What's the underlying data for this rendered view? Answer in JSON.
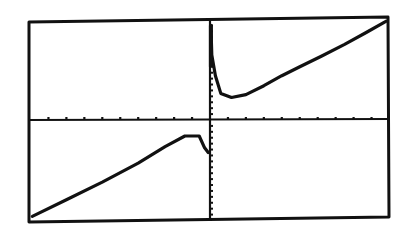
{
  "chart_data": {
    "type": "line",
    "title": "",
    "xlabel": "",
    "ylabel": "",
    "xlim": [
      -10,
      10
    ],
    "ylim": [
      -17,
      17
    ],
    "x_tick_step": 1,
    "y_tick_step": 1,
    "grid": false,
    "legend": null,
    "vertical_asymptote_x": 0,
    "series": [
      {
        "name": "left-branch",
        "points": [
          [
            -9.9,
            -16.3
          ],
          [
            -8,
            -13.5
          ],
          [
            -6,
            -10.5
          ],
          [
            -4,
            -7.3
          ],
          [
            -2.5,
            -4.5
          ],
          [
            -1.4,
            -2.7
          ],
          [
            -0.6,
            -2.7
          ],
          [
            -0.3,
            -4.7
          ],
          [
            -0.1,
            -5.5
          ]
        ]
      },
      {
        "name": "right-branch",
        "points": [
          [
            0.05,
            16
          ],
          [
            0.1,
            11
          ],
          [
            0.3,
            7.5
          ],
          [
            0.6,
            4.5
          ],
          [
            1.2,
            3.8
          ],
          [
            2,
            4.3
          ],
          [
            3,
            5.8
          ],
          [
            4,
            7.5
          ],
          [
            5,
            9
          ],
          [
            6.2,
            10.8
          ],
          [
            7.5,
            12.8
          ],
          [
            8.7,
            14.8
          ],
          [
            9.8,
            16.7
          ]
        ]
      }
    ]
  },
  "colors": {
    "ink": "#111111",
    "background": "#ffffff"
  }
}
